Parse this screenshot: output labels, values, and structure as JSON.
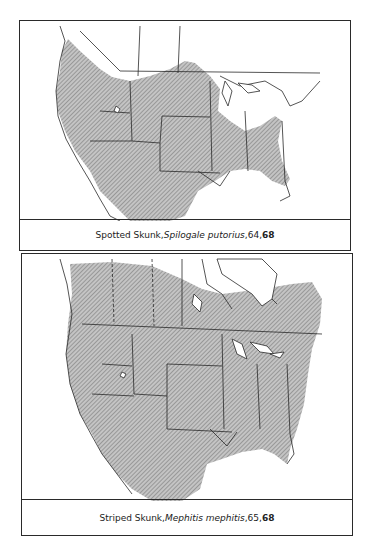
{
  "maps": [
    {
      "id": "spotted-skunk",
      "common_name": "Spotted Skunk",
      "scientific_name": "Spilogale putorius",
      "page_ref": "64",
      "plate_ref": "68",
      "separator": ", ",
      "range_description": "Western and central United States into Mexico, southeastern US; absent from Great Lakes/Northeast and Canada (except southwest BC)"
    },
    {
      "id": "striped-skunk",
      "common_name": "Striped Skunk",
      "scientific_name": "Mephitis mephitis",
      "page_ref": "65",
      "plate_ref": "68",
      "separator": ", ",
      "range_description": "Southern Canada, all of contiguous United States, northern Mexico"
    }
  ],
  "colors": {
    "range_fill": "#b8b8b8",
    "hatch": "#7a7a7a",
    "borders": "#2a2a2a",
    "background": "#ffffff"
  }
}
